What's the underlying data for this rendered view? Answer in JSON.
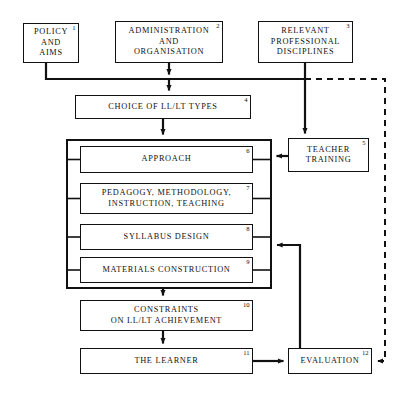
{
  "diagram": {
    "canvas": {
      "width": 407,
      "height": 394
    },
    "colors": {
      "line": "#111111",
      "background": "#ffffff",
      "dashed_line": "#111111"
    },
    "nodes": [
      {
        "id": "policy",
        "num": "1",
        "label": "POLICY\nAND\nAIMS",
        "x": 23,
        "y": 23,
        "w": 56,
        "h": 40
      },
      {
        "id": "admin",
        "num": "2",
        "label": "ADMINISTRATION\nAND\nORGANISATION",
        "x": 115,
        "y": 21,
        "w": 108,
        "h": 42
      },
      {
        "id": "disciplines",
        "num": "3",
        "label": "RELEVANT\nPROFESSIONAL\nDISCIPLINES",
        "x": 258,
        "y": 21,
        "w": 95,
        "h": 42
      },
      {
        "id": "choice",
        "num": "4",
        "label": "CHOICE OF LL/LT TYPES",
        "x": 75,
        "y": 95,
        "w": 176,
        "h": 24
      },
      {
        "id": "teacher",
        "num": "5",
        "label": "TEACHER\nTRAINING",
        "x": 288,
        "y": 138,
        "w": 81,
        "h": 34
      },
      {
        "id": "approach",
        "num": "6",
        "label": "APPROACH",
        "x": 80,
        "y": 146,
        "w": 173,
        "h": 27
      },
      {
        "id": "pedagogy",
        "num": "7",
        "label": "PEDAGOGY, METHODOLOGY,\nINSTRUCTION, TEACHING",
        "x": 80,
        "y": 183,
        "w": 173,
        "h": 31
      },
      {
        "id": "syllabus",
        "num": "8",
        "label": "SYLLABUS DESIGN",
        "x": 80,
        "y": 224,
        "w": 173,
        "h": 26
      },
      {
        "id": "materials",
        "num": "9",
        "label": "MATERIALS CONSTRUCTION",
        "x": 80,
        "y": 257,
        "w": 173,
        "h": 26
      },
      {
        "id": "constraints",
        "num": "10",
        "label": "CONSTRAINTS\nON LL/LT ACHIEVEMENT",
        "x": 80,
        "y": 300,
        "w": 173,
        "h": 31
      },
      {
        "id": "learner",
        "num": "11",
        "label": "THE LEARNER",
        "x": 80,
        "y": 348,
        "w": 173,
        "h": 26
      },
      {
        "id": "evaluation",
        "num": "12",
        "label": "EVALUATION",
        "x": 288,
        "y": 348,
        "w": 84,
        "h": 26
      }
    ],
    "group": {
      "id": "core-group",
      "x": 66,
      "y": 139,
      "w": 206,
      "h": 150
    },
    "connectors": [
      {
        "id": "policy-to-bus",
        "type": "solid",
        "from": "policy",
        "to": "bus"
      },
      {
        "id": "admin-to-bus",
        "type": "arrow",
        "from": "admin",
        "to": "bus"
      },
      {
        "id": "disciplines-to-bus",
        "type": "solid",
        "from": "disciplines",
        "to": "bus"
      },
      {
        "id": "bus-to-choice",
        "type": "arrow",
        "from": "bus",
        "to": "choice"
      },
      {
        "id": "choice-to-group",
        "type": "arrow",
        "from": "choice",
        "to": "core-group"
      },
      {
        "id": "disciplines-to-teacher",
        "type": "arrow",
        "from": "disciplines",
        "to": "teacher"
      },
      {
        "id": "teacher-to-approach",
        "type": "arrow",
        "from": "teacher",
        "to": "approach"
      },
      {
        "id": "group-to-constraints",
        "type": "arrow",
        "from": "core-group",
        "to": "constraints"
      },
      {
        "id": "constraints-to-learner",
        "type": "arrow",
        "from": "constraints",
        "to": "learner"
      },
      {
        "id": "learner-to-evaluation",
        "type": "arrow",
        "from": "learner",
        "to": "evaluation"
      },
      {
        "id": "evaluation-feedback",
        "type": "arrow",
        "from": "evaluation",
        "to": "core-group"
      },
      {
        "id": "disciplines-dashed-evaluation",
        "type": "dashed",
        "from": "bus",
        "to": "evaluation"
      }
    ]
  }
}
